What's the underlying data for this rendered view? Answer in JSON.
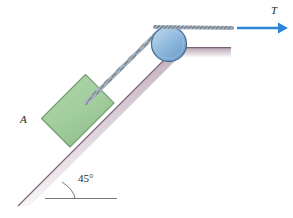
{
  "figure": {
    "type": "free-body-mechanics-diagram"
  },
  "labels": {
    "block_label": "A",
    "tension_label": "T",
    "angle_label": "45°"
  },
  "colors": {
    "block_fill": "#a4cfa0",
    "block_stroke": "#6f9a6c",
    "pulley_fill": "#8fb9dd",
    "pulley_stroke": "#4a6e93",
    "incline_top": "#8e7186",
    "incline_fill": "#cfc0cb",
    "arrow": "#2e86d8",
    "cable": "#93a2ae",
    "text": "#231f20"
  },
  "elements": {
    "incline_angle_deg": 45,
    "block_name": "block-A",
    "pulley_name": "pulley",
    "cable_name": "cable",
    "force_name": "tension-force-arrow",
    "ledge_name": "horizontal-ledge",
    "angle_arc_name": "angle-arc",
    "baseline_name": "horizontal-reference-line"
  }
}
